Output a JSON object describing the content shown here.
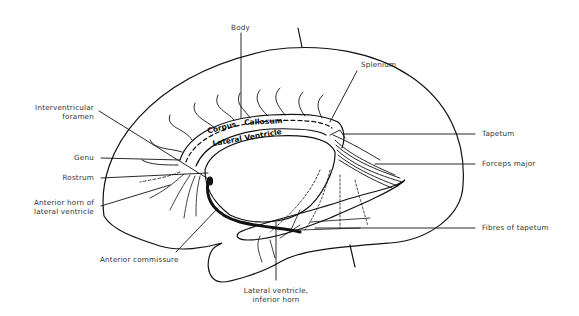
{
  "diagram": {
    "labels": {
      "body": "Body",
      "splenium": "Splenium",
      "interventricular_1": "Interventricular",
      "interventricular_2": "foramen",
      "genu": "Genu",
      "rostrum": "Rostrum",
      "anterior_horn_1": "Anterior horn of",
      "anterior_horn_2": "lateral ventricle",
      "tapetum": "Tapetum",
      "forceps_major": "Forceps major",
      "fibres_tapetum": "Fibres of tapetum",
      "anterior_commissure": "Anterior commissure",
      "inferior_horn_1": "Lateral ventricle,",
      "inferior_horn_2": "inferior horn"
    },
    "inner_labels": {
      "corpus": "Corpus",
      "callosum": "Callosum",
      "lateral_ventricle": "Lateral Ventricle"
    },
    "colors": {
      "line": "#111111",
      "text": "#333333",
      "background": "#ffffff"
    }
  }
}
